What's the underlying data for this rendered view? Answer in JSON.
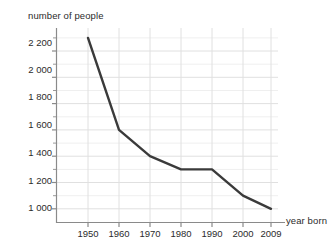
{
  "chart_data": {
    "type": "line",
    "title": "",
    "subtitle": "",
    "xlabel": "year born",
    "ylabel": "number of people",
    "x": [
      1950,
      1960,
      1970,
      1980,
      1990,
      2000,
      2009
    ],
    "categories": [
      "1950",
      "1960",
      "1970",
      "1980",
      "1990",
      "2000",
      "2009"
    ],
    "values": [
      2300,
      1600,
      1400,
      1300,
      1300,
      1100,
      1000
    ],
    "series": [
      {
        "name": "number of people",
        "values": [
          2300,
          1600,
          1400,
          1300,
          1300,
          1100,
          1000
        ]
      }
    ],
    "xtick_labels": [
      "1950",
      "1960",
      "1970",
      "1980",
      "1990",
      "2000",
      "2009"
    ],
    "ytick_labels": [
      "1 000",
      "1 200",
      "1 400",
      "1 600",
      "1 800",
      "2 000",
      "2 200"
    ],
    "ytick_values": [
      1000,
      1200,
      1400,
      1600,
      1800,
      2000,
      2200
    ],
    "ylim": [
      900,
      2360
    ],
    "xlim": [
      1945,
      2014
    ],
    "grid": "both",
    "minor_ticks": true,
    "legend": "none",
    "line_color": "#3a3a3a",
    "grid_color": "#e0e0e0",
    "axis_color": "#808080",
    "background": "#ffffff"
  },
  "axis_titles": {
    "y": "number of people",
    "x": "year born"
  }
}
